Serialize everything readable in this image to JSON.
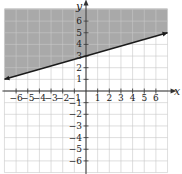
{
  "chart_data": {
    "type": "line",
    "title": "",
    "xlabel": "x",
    "ylabel": "y",
    "xlim": [
      -7,
      7
    ],
    "ylim": [
      -7,
      7
    ],
    "grid": true,
    "x_ticks": [
      -6,
      -5,
      -4,
      -3,
      -2,
      -1,
      1,
      2,
      3,
      4,
      5,
      6
    ],
    "y_ticks": [
      -6,
      -5,
      -4,
      -3,
      -2,
      -1,
      1,
      2,
      3,
      4,
      5,
      6
    ],
    "x_tick_labels": [
      "−6",
      "−5",
      "−4",
      "−3",
      "−2",
      "−1",
      "1",
      "2",
      "3",
      "4",
      "5",
      "6"
    ],
    "y_tick_labels": [
      "−6",
      "−5",
      "−4",
      "−3",
      "−2",
      "−1",
      "1",
      "2",
      "3",
      "4",
      "5",
      "6"
    ],
    "series": [
      {
        "name": "boundary line",
        "equation": "y = (2/7)x + 3",
        "x": [
          -7,
          7
        ],
        "y": [
          1,
          5
        ],
        "style": "solid",
        "arrows": "both ends"
      }
    ],
    "shaded_region": {
      "description": "Region above the line (y ≥ (2/7)x + 3)",
      "color": "#a9a9a9"
    }
  },
  "colors": {
    "shade": "#a9a9a9",
    "grid": "#c8c8c8",
    "axis": "#333333",
    "line": "#1a1a1a"
  }
}
